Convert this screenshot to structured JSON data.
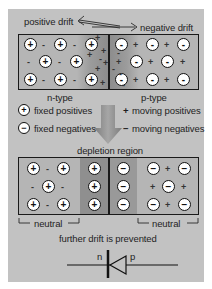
{
  "header": {
    "positive_drift": "positive drift",
    "negative_drift": "negative drift"
  },
  "top_box": {
    "n_side": {
      "ions": [
        "+",
        "+",
        "+",
        "+",
        "+",
        "+",
        "+",
        "+"
      ],
      "carriers": [
        "-",
        "-",
        "-",
        "-",
        "-",
        "-"
      ]
    },
    "p_side": {
      "ions": [
        "-",
        "-",
        "-",
        "-",
        "-",
        "-",
        "-",
        "-"
      ],
      "carriers": [
        "+",
        "+",
        "+",
        "+",
        "+",
        "+"
      ]
    }
  },
  "labels": {
    "n_type": "n-type",
    "p_type": "p-type"
  },
  "legend": {
    "fixed_positives": {
      "symbol": "+",
      "label": "fixed positives"
    },
    "fixed_negatives": {
      "symbol": "−",
      "label": "fixed negatives"
    },
    "moving_positives": {
      "symbol": "+",
      "label": "moving positives"
    },
    "moving_negatives": {
      "symbol": "−",
      "label": "moving negatives"
    }
  },
  "bottom_section": {
    "title": "depletion region",
    "neutral_left": "neutral",
    "neutral_right": "neutral",
    "caption": "further drift is prevented"
  },
  "diode": {
    "n_label": "n",
    "p_label": "p"
  },
  "colors": {
    "panel_bg": "#c2c2c2",
    "box_bg": "#b5b5b5",
    "depletion_dark": "#8f8f8f",
    "line": "#1a1a1a"
  }
}
